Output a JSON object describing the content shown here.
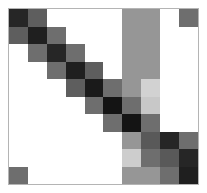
{
  "figure": {
    "title": "",
    "background_color": "#ffffff",
    "border_color": "#b4b4b4"
  },
  "chart_data": {
    "type": "heatmap",
    "title": "",
    "xlabel": "",
    "ylabel": "",
    "grid": false,
    "legend": "none",
    "n_rows": 10,
    "n_cols": 10,
    "x": [
      "1",
      "2",
      "3",
      "4",
      "5",
      "6",
      "7",
      "8",
      "9",
      "10"
    ],
    "categories": [
      "1",
      "2",
      "3",
      "4",
      "5",
      "6",
      "7",
      "8",
      "9",
      "10"
    ],
    "row_labels": [
      "1",
      "2",
      "3",
      "4",
      "5",
      "6",
      "7",
      "8",
      "9",
      "10"
    ],
    "col_labels": [
      "1",
      "2",
      "3",
      "4",
      "5",
      "6",
      "7",
      "8",
      "9",
      "10"
    ],
    "zlim": [
      0,
      1
    ],
    "colormap": "grayscale-reversed",
    "values": [
      [
        0.88,
        0.58,
        0.0,
        0.0,
        0.0,
        0.0,
        0.5,
        0.5,
        0.0,
        0.55
      ],
      [
        0.58,
        0.9,
        0.55,
        0.0,
        0.0,
        0.0,
        0.5,
        0.5,
        0.0,
        0.0
      ],
      [
        0.0,
        0.55,
        0.88,
        0.55,
        0.0,
        0.0,
        0.5,
        0.5,
        0.0,
        0.0
      ],
      [
        0.0,
        0.0,
        0.55,
        0.9,
        0.58,
        0.0,
        0.5,
        0.5,
        0.0,
        0.0
      ],
      [
        0.0,
        0.0,
        0.0,
        0.58,
        0.92,
        0.55,
        0.5,
        0.18,
        0.0,
        0.0
      ],
      [
        0.0,
        0.0,
        0.0,
        0.0,
        0.55,
        0.95,
        0.55,
        0.22,
        0.0,
        0.0
      ],
      [
        0.0,
        0.0,
        0.0,
        0.0,
        0.0,
        0.55,
        0.95,
        0.55,
        0.0,
        0.0
      ],
      [
        0.0,
        0.0,
        0.0,
        0.0,
        0.0,
        0.0,
        0.5,
        0.62,
        0.88,
        0.55
      ],
      [
        0.0,
        0.0,
        0.0,
        0.0,
        0.0,
        0.0,
        0.2,
        0.55,
        0.62,
        0.88
      ],
      [
        0.55,
        0.0,
        0.0,
        0.0,
        0.0,
        0.0,
        0.5,
        0.5,
        0.55,
        0.9
      ]
    ],
    "cell_colors": [
      [
        "#262626",
        "#5e5e5e",
        "#ffffff",
        "#ffffff",
        "#ffffff",
        "#ffffff",
        "#969696",
        "#969696",
        "#ffffff",
        "#6e6e6e"
      ],
      [
        "#5e5e5e",
        "#1f1f1f",
        "#6e6e6e",
        "#ffffff",
        "#ffffff",
        "#ffffff",
        "#969696",
        "#969696",
        "#ffffff",
        "#ffffff"
      ],
      [
        "#ffffff",
        "#6e6e6e",
        "#262626",
        "#6e6e6e",
        "#ffffff",
        "#ffffff",
        "#969696",
        "#969696",
        "#ffffff",
        "#ffffff"
      ],
      [
        "#ffffff",
        "#ffffff",
        "#6e6e6e",
        "#1f1f1f",
        "#5e5e5e",
        "#ffffff",
        "#969696",
        "#969696",
        "#ffffff",
        "#ffffff"
      ],
      [
        "#ffffff",
        "#ffffff",
        "#ffffff",
        "#5e5e5e",
        "#1a1a1a",
        "#6e6e6e",
        "#969696",
        "#d2d2d2",
        "#ffffff",
        "#ffffff"
      ],
      [
        "#ffffff",
        "#ffffff",
        "#ffffff",
        "#ffffff",
        "#6e6e6e",
        "#141414",
        "#6e6e6e",
        "#c8c8c8",
        "#ffffff",
        "#ffffff"
      ],
      [
        "#ffffff",
        "#ffffff",
        "#ffffff",
        "#ffffff",
        "#ffffff",
        "#6e6e6e",
        "#141414",
        "#6e6e6e",
        "#ffffff",
        "#ffffff"
      ],
      [
        "#ffffff",
        "#ffffff",
        "#ffffff",
        "#ffffff",
        "#ffffff",
        "#ffffff",
        "#969696",
        "#595959",
        "#262626",
        "#6e6e6e"
      ],
      [
        "#ffffff",
        "#ffffff",
        "#ffffff",
        "#ffffff",
        "#ffffff",
        "#ffffff",
        "#cdcdcd",
        "#6e6e6e",
        "#595959",
        "#262626"
      ],
      [
        "#6e6e6e",
        "#ffffff",
        "#ffffff",
        "#ffffff",
        "#ffffff",
        "#ffffff",
        "#969696",
        "#969696",
        "#6e6e6e",
        "#1f1f1f"
      ]
    ]
  }
}
